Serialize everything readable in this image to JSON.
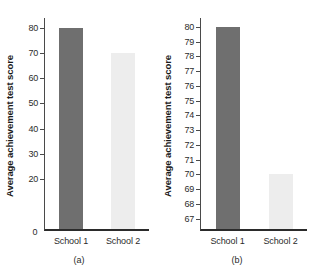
{
  "figure": {
    "background": "#ffffff",
    "bar_colors": {
      "school_1": "#6f6f6f",
      "school_2": "#ededed"
    },
    "axis_color": "#4a4a4a",
    "baseline_color": "#2b2b2b"
  },
  "chart_data": [
    {
      "type": "bar",
      "panel": "a",
      "caption": "(a)",
      "title": "",
      "xlabel": "",
      "ylabel": "Average achievement test score",
      "categories": [
        "School 1",
        "School 2"
      ],
      "values": [
        80,
        70
      ],
      "colors": [
        "#6f6f6f",
        "#ededed"
      ],
      "ylim": [
        0,
        84
      ],
      "yticks": [
        20,
        30,
        40,
        50,
        60,
        70,
        80
      ],
      "ytick_labels": [
        "20",
        "30",
        "40",
        "50",
        "60",
        "70",
        "80"
      ],
      "zero_label": "0",
      "grid": false,
      "legend": "none"
    },
    {
      "type": "bar",
      "panel": "b",
      "caption": "(b)",
      "title": "",
      "xlabel": "",
      "ylabel": "Average achievement test score",
      "categories": [
        "School 1",
        "School 2"
      ],
      "values": [
        80,
        70
      ],
      "colors": [
        "#6f6f6f",
        "#ededed"
      ],
      "ylim": [
        66.3,
        80.6
      ],
      "yticks": [
        67,
        68,
        69,
        70,
        71,
        72,
        73,
        74,
        75,
        76,
        77,
        78,
        79,
        80
      ],
      "ytick_labels": [
        "67",
        "68",
        "69",
        "70",
        "71",
        "72",
        "73",
        "74",
        "75",
        "76",
        "77",
        "78",
        "79",
        "80"
      ],
      "grid": false,
      "legend": "none"
    }
  ]
}
